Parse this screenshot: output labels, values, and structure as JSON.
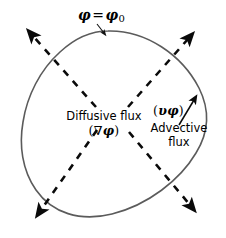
{
  "figure": {
    "type": "diagram",
    "background_color": "#ffffff",
    "boundary": {
      "name": "control-volume-boundary",
      "stroke_color": "#5b5b5b",
      "stroke_width": 1.6,
      "label_text": "φ = φ",
      "label_phi": "φ",
      "label_equals": "=",
      "label_subscript": "0",
      "leader_arrow": "points from label down-right to boundary curve"
    },
    "diffusive": {
      "name": "diffusive-flux",
      "label": "Diffusive flux",
      "symbol_open": "(",
      "symbol_nabla": "∇",
      "symbol_phi": "φ",
      "symbol_close": ")",
      "style": "dashed",
      "color": "#000000",
      "arrow_count": 4,
      "arrow_directions": [
        "up-left",
        "up-right",
        "down-left",
        "down-right"
      ]
    },
    "advective": {
      "name": "advective-flux",
      "symbol_open": "(",
      "symbol_v": "υ",
      "symbol_phi": "φ",
      "symbol_close": ")",
      "label_line1": "Advective",
      "label_line2": "flux",
      "style": "solid",
      "color": "#000000",
      "arrow_direction": "up-right"
    },
    "colors": {
      "boundary": "#5b5b5b",
      "dashed_arrows": "#0a0a0a",
      "solid_arrow": "#0a0a0a",
      "text": "#000000"
    }
  }
}
